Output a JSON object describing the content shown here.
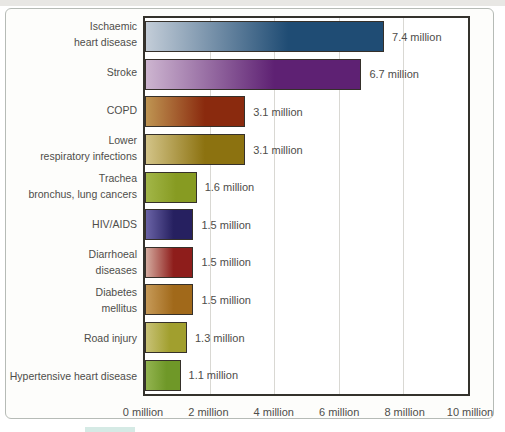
{
  "page": {
    "bottom_fragment_color": "#d5eae5"
  },
  "chart_data": {
    "type": "bar",
    "orientation": "horizontal",
    "title": "",
    "xlabel": "",
    "ylabel": "",
    "xlim": [
      0,
      10
    ],
    "x_unit": "million",
    "grid": "vertical",
    "legend": "none",
    "x_ticks": [
      "0 million",
      "2 million",
      "4 million",
      "6 million",
      "8 million",
      "10 million"
    ],
    "categories": [
      "Ischaemic heart disease",
      "Stroke",
      "COPD",
      "Lower respiratory infections",
      "Trachea bronchus, lung cancers",
      "HIV/AIDS",
      "Diarrhoeal diseases",
      "Diabetes mellitus",
      "Road injury",
      "Hypertensive heart disease"
    ],
    "values": [
      7.4,
      6.7,
      3.1,
      3.1,
      1.6,
      1.5,
      1.5,
      1.5,
      1.3,
      1.1
    ],
    "rows": [
      {
        "label": "Ischaemic\nheart disease",
        "value": 7.4,
        "value_label": "7.4 million",
        "color_light": "#c3cdd8",
        "color_dark": "#1f4c74"
      },
      {
        "label": "Stroke",
        "value": 6.7,
        "value_label": "6.7 million",
        "color_light": "#cdb5d0",
        "color_dark": "#5e2173"
      },
      {
        "label": "COPD",
        "value": 3.1,
        "value_label": "3.1 million",
        "color_light": "#bf9552",
        "color_dark": "#8a2a0e"
      },
      {
        "label": "Lower\nrespiratory infections",
        "value": 3.1,
        "value_label": "3.1 million",
        "color_light": "#d3c488",
        "color_dark": "#8c7210"
      },
      {
        "label": "Trachea\nbronchus, lung cancers",
        "value": 1.6,
        "value_label": "1.6 million",
        "color_light": "#a2b648",
        "color_dark": "#879b22"
      },
      {
        "label": "HIV/AIDS",
        "value": 1.5,
        "value_label": "1.5 million",
        "color_light": "#6a63a6",
        "color_dark": "#262060"
      },
      {
        "label": "Diarrhoeal\ndiseases",
        "value": 1.5,
        "value_label": "1.5 million",
        "color_light": "#d4ab9f",
        "color_dark": "#8e1d1b"
      },
      {
        "label": "Diabetes\nmellitus",
        "value": 1.5,
        "value_label": "1.5 million",
        "color_light": "#c69a58",
        "color_dark": "#a1691a"
      },
      {
        "label": "Road injury",
        "value": 1.3,
        "value_label": "1.3 million",
        "color_light": "#c8c276",
        "color_dark": "#a19f2e"
      },
      {
        "label": "Hypertensive heart disease",
        "value": 1.1,
        "value_label": "1.1 million",
        "color_light": "#93b450",
        "color_dark": "#6f9828"
      }
    ],
    "gradient_note": "each bar fades from color_light at left to color_dark toward right end"
  }
}
